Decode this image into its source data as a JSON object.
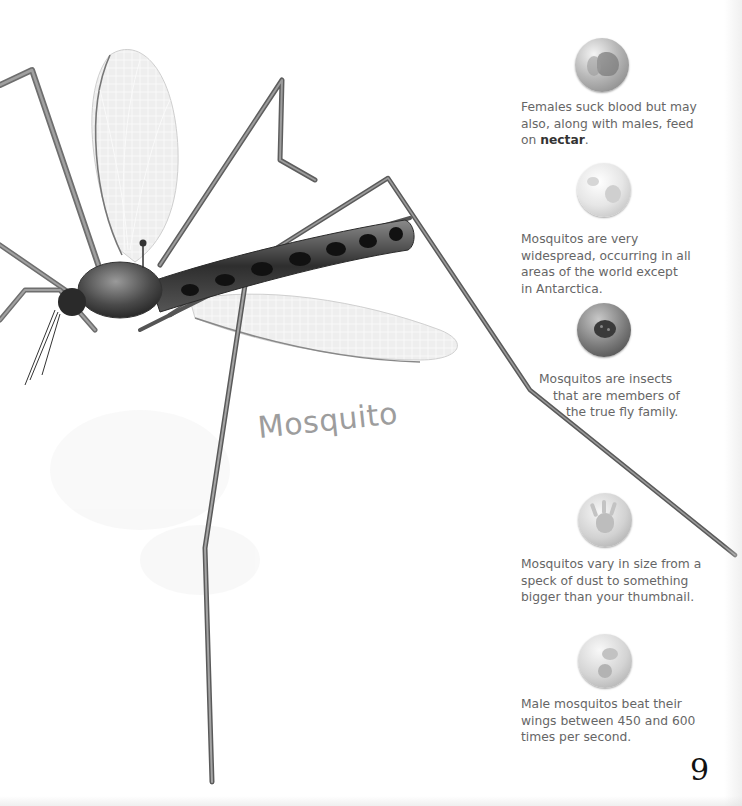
{
  "page": {
    "title": "Mosquito",
    "page_number": "9"
  },
  "facts": [
    {
      "icon": "mouth-icon",
      "lines": [
        "Females suck blood but may",
        "also, along with males, feed"
      ],
      "last_line_prefix": "on ",
      "last_line_bold": "nectar",
      "last_line_suffix": "."
    },
    {
      "icon": "globe-icon",
      "lines": [
        "Mosquitos are very",
        "widespread, occurring in all",
        "areas of the world except",
        "in Antarctica."
      ]
    },
    {
      "icon": "ladybug-icon",
      "lines": [
        "Mosquitos are insects",
        "that are members of",
        "the true fly family."
      ]
    },
    {
      "icon": "hand-icon",
      "lines": [
        "Mosquitos vary in size from a",
        "speck of dust to something",
        "bigger than your thumbnail."
      ]
    },
    {
      "icon": "wing-beat-icon",
      "lines": [
        "Male mosquitos beat their",
        "wings between 450 and 600",
        "times per second."
      ]
    }
  ]
}
